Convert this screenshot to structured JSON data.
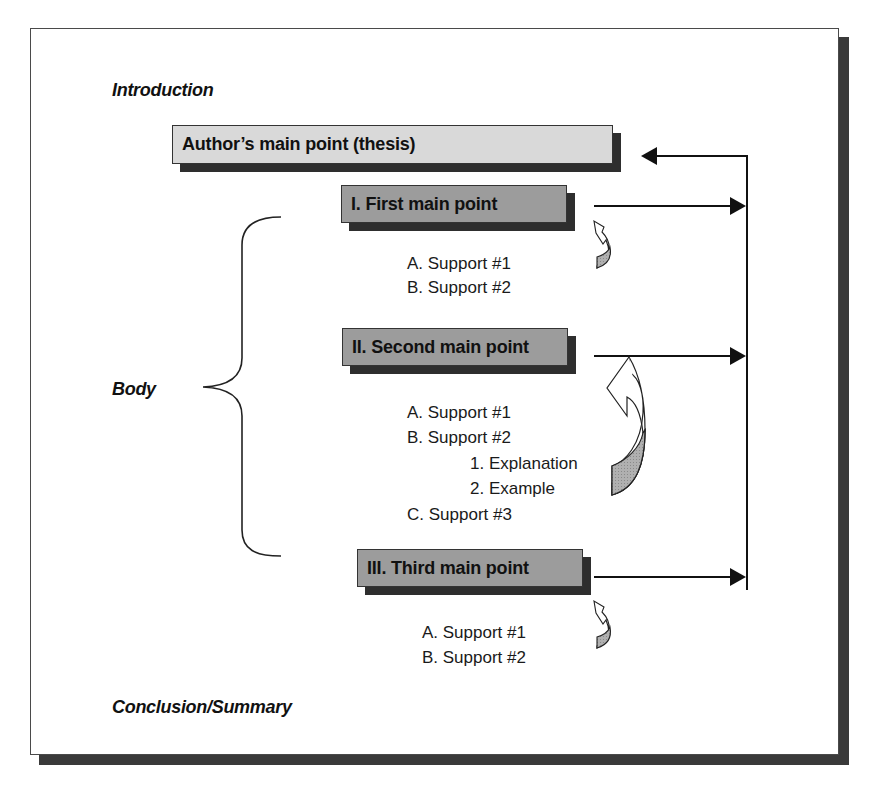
{
  "diagram": {
    "title_sections": {
      "introduction": "Introduction",
      "body": "Body",
      "conclusion": "Conclusion/Summary"
    },
    "thesis": {
      "label": "Author’s main point (thesis)"
    },
    "main_points": [
      {
        "label": "I. First main point",
        "supports": [
          "A. Support #1",
          "B. Support #2"
        ]
      },
      {
        "label": "II. Second main point",
        "supports": [
          "A. Support #1",
          "B. Support #2"
        ],
        "sub_items": [
          "1. Explanation",
          "2. Example"
        ],
        "supports_after": [
          "C. Support #3"
        ]
      },
      {
        "label": "III. Third main point",
        "supports": [
          "A. Support #1",
          "B. Support #2"
        ]
      }
    ],
    "icons": {
      "curved_arrow": "curved-up-arrow-icon",
      "return_arrow": "arrow-left-icon",
      "point_arrow": "arrow-right-icon",
      "brace": "curly-brace-icon"
    },
    "colors": {
      "thesis_fill": "#d9d9d9",
      "point_fill": "#9c9c9c",
      "shadow": "#2e2e2e",
      "line": "#111111",
      "curved_arrow_fill": "#a8a8a8"
    }
  }
}
